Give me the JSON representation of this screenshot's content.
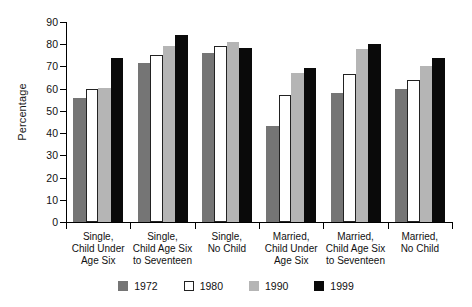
{
  "chart_data": {
    "type": "bar",
    "title": "",
    "xlabel": "",
    "ylabel": "Percentage",
    "ylim": [
      0,
      90
    ],
    "ytick_step": 10,
    "yticks": [
      90,
      80,
      70,
      60,
      50,
      40,
      30,
      20,
      10,
      0
    ],
    "grid": false,
    "legend_position": "bottom",
    "categories": [
      "Single,\nChild Under\nAge Six",
      "Single,\nChild Age Six\nto Seventeen",
      "Single,\nNo Child",
      "Married,\nChild Under\nAge Six",
      "Married,\nChild Age Six\nto Seventeen",
      "Married,\nNo Child"
    ],
    "category_lines": [
      [
        "Single,",
        "Child Under",
        "Age Six"
      ],
      [
        "Single,",
        "Child Age Six",
        "to Seventeen"
      ],
      [
        "Single,",
        "No Child"
      ],
      [
        "Married,",
        "Child Under",
        "Age Six"
      ],
      [
        "Married,",
        "Child Age Six",
        "to Seventeen"
      ],
      [
        "Married,",
        "No Child"
      ]
    ],
    "series": [
      {
        "name": "1972",
        "color": "#757575",
        "values": [
          56,
          71.5,
          76,
          43,
          58,
          60
        ]
      },
      {
        "name": "1980",
        "color": "#ffffff",
        "values": [
          60,
          75,
          79,
          57,
          66.5,
          64
        ]
      },
      {
        "name": "1990",
        "color": "#b5b5b5",
        "values": [
          60.5,
          79,
          81,
          67,
          78,
          70
        ]
      },
      {
        "name": "1999",
        "color": "#0a0a0a",
        "values": [
          74,
          84,
          78.5,
          69.5,
          80,
          74
        ]
      }
    ]
  },
  "legend": {
    "items": [
      {
        "label": "1972",
        "swatch": "c1972"
      },
      {
        "label": "1980",
        "swatch": "c1980"
      },
      {
        "label": "1990",
        "swatch": "c1990"
      },
      {
        "label": "1999",
        "swatch": "c1999"
      }
    ]
  },
  "axis": {
    "y_title": "Percentage"
  }
}
